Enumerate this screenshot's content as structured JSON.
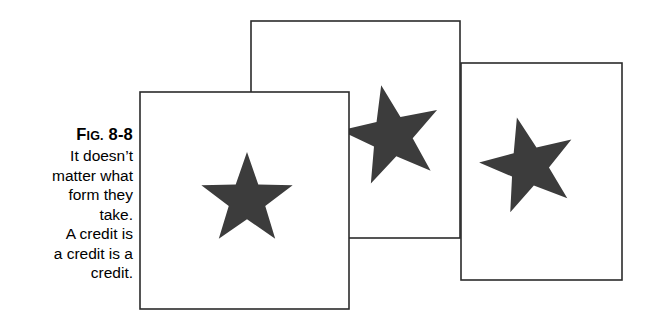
{
  "figure": {
    "caption": {
      "label_prefix": "F",
      "label_smallcaps": "IG.",
      "label_number": "8-8",
      "label_full": "Fig. 8-8",
      "lines": [
        "It doesn’t",
        "matter what",
        "form they",
        "take.",
        "A credit is",
        "a credit is a",
        "credit."
      ]
    },
    "colors": {
      "background": "#ffffff",
      "outline": "#2b2b2b",
      "star_fill": "#3c3c3c",
      "text": "#000000"
    },
    "cards": [
      {
        "name": "back-card",
        "x": 251,
        "y": 21,
        "width": 209,
        "height": 217,
        "star": {
          "cx": 392,
          "cy": 136,
          "radius": 52,
          "rotation": -12
        }
      },
      {
        "name": "right-card",
        "x": 461,
        "y": 63,
        "width": 161,
        "height": 217,
        "star": {
          "cx": 529,
          "cy": 166,
          "radius": 50,
          "rotation": -14
        }
      },
      {
        "name": "front-card",
        "x": 140,
        "y": 92,
        "width": 209,
        "height": 217,
        "star": {
          "cx": 247,
          "cy": 200,
          "radius": 48,
          "rotation": 0
        }
      }
    ]
  }
}
